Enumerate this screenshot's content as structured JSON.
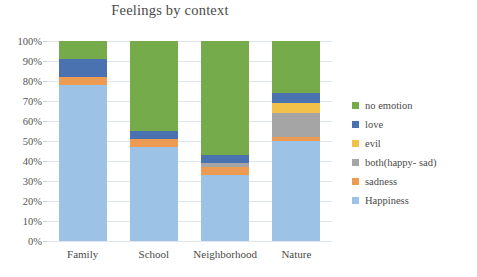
{
  "chart_data": {
    "type": "bar",
    "subtype": "stacked-percent",
    "title": "Feelings by context",
    "xlabel": "",
    "ylabel": "",
    "ylim": [
      0,
      100
    ],
    "ytick_labels": [
      "0%",
      "10%",
      "20%",
      "30%",
      "40%",
      "50%",
      "60%",
      "70%",
      "80%",
      "90%",
      "100%"
    ],
    "ytick_values": [
      0,
      10,
      20,
      30,
      40,
      50,
      60,
      70,
      80,
      90,
      100
    ],
    "grid": true,
    "legend_position": "right",
    "categories": [
      "Family",
      "School",
      "Neighborhood",
      "Nature"
    ],
    "series": [
      {
        "name": "Happiness",
        "color": "#9cc3e5",
        "values": [
          78,
          47,
          33,
          50
        ]
      },
      {
        "name": "sadness",
        "color": "#ed9b53",
        "values": [
          4,
          4,
          4,
          2
        ]
      },
      {
        "name": "both(happy- sad)",
        "color": "#a5a5a5",
        "values": [
          0,
          0,
          2,
          12
        ]
      },
      {
        "name": "evil",
        "color": "#f2c14a",
        "values": [
          0,
          0,
          0,
          5
        ]
      },
      {
        "name": "love",
        "color": "#4a72b0",
        "values": [
          9,
          4,
          4,
          5
        ]
      },
      {
        "name": "no emotion",
        "color": "#76ab4b",
        "values": [
          9,
          45,
          57,
          26
        ]
      }
    ],
    "legend_order": [
      "no emotion",
      "love",
      "evil",
      "both(happy- sad)",
      "sadness",
      "Happiness"
    ]
  },
  "background_text": {
    "line1": "",
    "line2": "",
    "line3": "",
    "right1": "",
    "right2": "",
    "right3": "",
    "right4": ""
  }
}
